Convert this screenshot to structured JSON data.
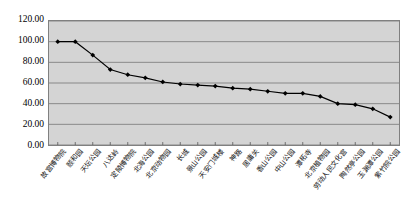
{
  "chart_data": {
    "type": "line",
    "title": "",
    "subtitle": "",
    "xlabel": "",
    "ylabel": "",
    "ylim": [
      0,
      120
    ],
    "yticks": [
      0,
      20,
      40,
      60,
      80,
      100,
      120
    ],
    "ytick_labels": [
      "0.00",
      "20.00",
      "40.00",
      "60.00",
      "80.00",
      "100.00",
      "120.00"
    ],
    "grid": "horizontal",
    "legend": "none",
    "marker": "diamond",
    "line_color": "#000000",
    "marker_color": "#000000",
    "plot_bg": "#d4d4d4",
    "gridline_color": "#808080",
    "categories": [
      "故宫博物院",
      "颐和园",
      "天坛公园",
      "八达岭",
      "定陵博物院",
      "北海公园",
      "北京动物园",
      "长城",
      "景山公园",
      "天安门城楼",
      "神路",
      "居庸关",
      "香山公园",
      "中山公园",
      "潭柘寺",
      "北京植物园",
      "劳动人民文化宫",
      "陶然亭公园",
      "玉渊潭公园",
      "紫竹院公园"
    ],
    "values": [
      100,
      100,
      87,
      73,
      68,
      65,
      61,
      59,
      58,
      57,
      55,
      54,
      52,
      50,
      50,
      47,
      40,
      39,
      35,
      27
    ],
    "series": [
      {
        "name": "series-1",
        "values": [
          100,
          100,
          87,
          73,
          68,
          65,
          61,
          59,
          58,
          57,
          55,
          54,
          52,
          50,
          50,
          47,
          40,
          39,
          35,
          27
        ]
      }
    ]
  }
}
